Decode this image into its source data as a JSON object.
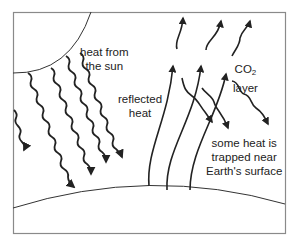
{
  "diagram": {
    "colors": {
      "frame": "#8a8a8a",
      "line": "#222222",
      "text": "#222222",
      "background": "#ffffff"
    },
    "labels": {
      "sun_heat": [
        "heat from",
        "the sun"
      ],
      "reflected": [
        "reflected",
        "heat"
      ],
      "co2_main": "CO",
      "co2_sub": "2",
      "co2_line2": "layer",
      "trapped": [
        "some heat is",
        "trapped near",
        "Earth's surface"
      ]
    },
    "elements": {
      "sun": "quarter-circle arc at top-left",
      "earth": "curved surface arc near bottom",
      "sun_rays": 5,
      "reflected_rays": 3,
      "escaping_rays": 3,
      "trapped_rays": 3
    }
  }
}
